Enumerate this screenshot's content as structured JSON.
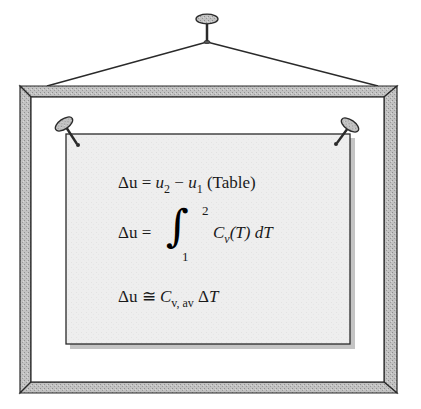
{
  "figure": {
    "colors": {
      "frame_fill": "#bdbdbd",
      "frame_outline": "#2a2a2a",
      "paper_fill": "#eeeeee",
      "paper_shadow": "#a8a8a8",
      "ink": "#1a1a1a",
      "pin_fill": "#9a9a9a"
    }
  },
  "equations": [
    {
      "id": "eq1",
      "lhs": "Δu",
      "op": "=",
      "term1": "u",
      "term1_sub": "2",
      "minus": "−",
      "term2": "u",
      "term2_sub": "1",
      "note": "(Table)"
    },
    {
      "id": "eq2",
      "lhs": "Δu",
      "op": "=",
      "integral": "∫",
      "upper_limit": "2",
      "lower_limit": "1",
      "integrand_var": "C",
      "integrand_sub": "v",
      "integrand_arg": "(T)",
      "differential": "dT"
    },
    {
      "id": "eq3",
      "lhs": "Δu",
      "op": "≅",
      "coef": "C",
      "coef_sub": "v, av",
      "delta": "Δ",
      "var": "T"
    }
  ]
}
